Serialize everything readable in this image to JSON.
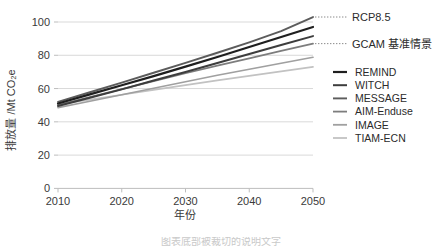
{
  "chart_data": {
    "type": "line",
    "title": "",
    "xlabel": "年份",
    "ylabel": "排放量 /Mt CO₂e",
    "x": [
      2010,
      2015,
      2020,
      2025,
      2030,
      2035,
      2040,
      2045,
      2050
    ],
    "xlim": [
      2010,
      2050
    ],
    "ylim": [
      0,
      105
    ],
    "xticks": [
      "2010",
      "2020",
      "2030",
      "2040",
      "2050"
    ],
    "yticks": [
      "0",
      "20",
      "40",
      "60",
      "80",
      "100"
    ],
    "ytick_values": [
      0,
      20,
      40,
      60,
      80,
      100
    ],
    "grid": "horizontal",
    "legend_position": "right",
    "series": [
      {
        "name": "REMIND",
        "color": "#1f1f1f",
        "width": 2.2,
        "values": [
          51.0,
          56.5,
          62.0,
          67.5,
          73.2,
          79.0,
          85.0,
          91.0,
          97.0
        ]
      },
      {
        "name": "WITCH",
        "color": "#3d3d3d",
        "width": 2.0,
        "values": [
          49.5,
          54.5,
          59.5,
          64.8,
          70.0,
          75.4,
          80.8,
          86.2,
          91.5
        ]
      },
      {
        "name": "MESSAGE",
        "color": "#5c5c5c",
        "width": 1.9,
        "values": [
          52.0,
          57.8,
          63.6,
          69.5,
          75.4,
          81.5,
          87.8,
          94.5,
          103.0
        ]
      },
      {
        "name": "AIM-Enduse",
        "color": "#7d7d7d",
        "width": 1.8,
        "values": [
          50.0,
          54.8,
          59.6,
          64.4,
          69.2,
          73.8,
          78.2,
          82.6,
          87.0
        ]
      },
      {
        "name": "IMAGE",
        "color": "#a0a0a0",
        "width": 1.7,
        "values": [
          48.5,
          52.4,
          56.3,
          60.2,
          64.1,
          68.0,
          71.6,
          75.2,
          78.8
        ]
      },
      {
        "name": "TIAM-ECN",
        "color": "#c2c2c2",
        "width": 1.7,
        "values": [
          50.5,
          53.4,
          56.3,
          59.2,
          62.1,
          64.9,
          67.6,
          70.3,
          73.0
        ]
      }
    ],
    "annotations": [
      {
        "label": "RCP8.5",
        "value": 103.0,
        "at_x": 2050,
        "series": "MESSAGE"
      },
      {
        "label": "GCAM 基准情景",
        "value": 87.0,
        "at_x": 2050,
        "series": "AIM-Enduse"
      }
    ]
  },
  "legend": {
    "items": [
      {
        "label": "REMIND"
      },
      {
        "label": "WITCH"
      },
      {
        "label": "MESSAGE"
      },
      {
        "label": "AIM-Enduse"
      },
      {
        "label": "IMAGE"
      },
      {
        "label": "TIAM-ECN"
      }
    ]
  },
  "footer": {
    "clipped_caption": "图表底部被裁切的说明文字"
  }
}
